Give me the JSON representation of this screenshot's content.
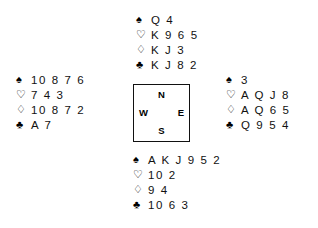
{
  "diagram": {
    "type": "bridge-deal",
    "suit_glyphs": {
      "spade": "♠",
      "heart": "♡",
      "diamond": "♢",
      "club": "♣"
    },
    "compass": {
      "north": "N",
      "south": "S",
      "west": "W",
      "east": "E"
    },
    "hands": {
      "north": {
        "spades": "Q 4",
        "hearts": "K 9 6 5",
        "diamonds": "K J 3",
        "clubs": "K J 8 2"
      },
      "west": {
        "spades": "10 8 7 6",
        "hearts": "7 4 3",
        "diamonds": "10 8 7 2",
        "clubs": "A 7"
      },
      "east": {
        "spades": "3",
        "hearts": "A Q J 8",
        "diamonds": "A Q 6 5",
        "clubs": "Q 9 5 4"
      },
      "south": {
        "spades": "A K J 9 5 2",
        "hearts": "10 2",
        "diamonds": "9 4",
        "clubs": "10 6 3"
      }
    }
  }
}
